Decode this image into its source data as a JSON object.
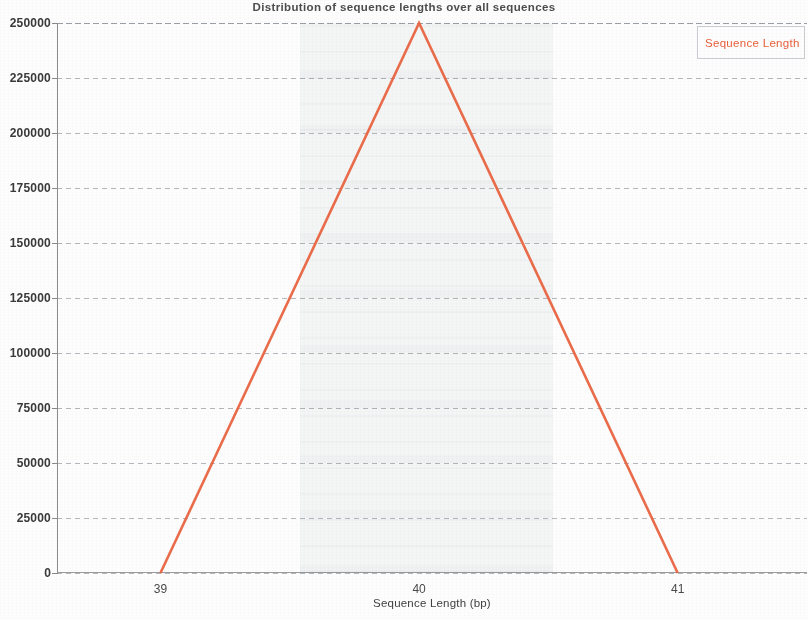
{
  "chart_data": {
    "type": "line",
    "title": "Distribution of sequence lengths over all sequences",
    "xlabel": "Sequence Length (bp)",
    "ylabel": "",
    "x": [
      39,
      40,
      41
    ],
    "xtick_labels": [
      "39",
      "40",
      "41"
    ],
    "xlim": [
      38.6,
      41.5
    ],
    "ylim": [
      0,
      250000
    ],
    "ytick_labels": [
      "250000",
      "225000",
      "200000",
      "175000",
      "150000",
      "125000",
      "100000",
      "75000",
      "50000",
      "25000",
      "0"
    ],
    "ytick_values": [
      250000,
      225000,
      200000,
      175000,
      150000,
      125000,
      100000,
      75000,
      50000,
      25000,
      0
    ],
    "grid": true,
    "legend_position": "top-right",
    "series": [
      {
        "name": "Sequence Length",
        "color": "#e8603c",
        "values": [
          0,
          250000,
          0
        ]
      }
    ]
  },
  "legend": {
    "entries": [
      {
        "label": "Sequence Length",
        "color": "#e8603c"
      }
    ]
  },
  "colors": {
    "series": "#e8603c",
    "axis": "#8c8c8c",
    "grid": "#787e88",
    "text": "#3a3a3a",
    "background": "#fdfdfd"
  }
}
